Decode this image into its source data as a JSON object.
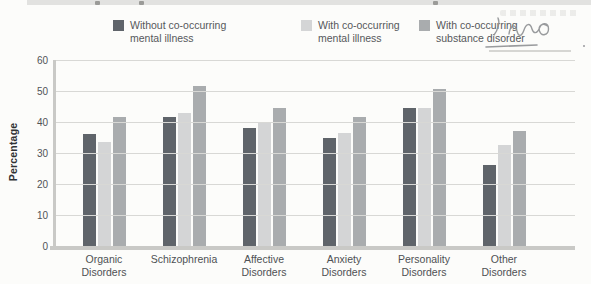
{
  "page": {
    "background": "#fcfcfa",
    "top_strip_color": "#e2e2e0"
  },
  "annotations": {
    "handwriting_present": true,
    "handwriting_color": "#8f9194"
  },
  "chart_data": {
    "type": "bar",
    "title": "",
    "xlabel": "",
    "ylabel": "Percentage",
    "ylim": [
      0,
      60
    ],
    "yticks": [
      0,
      10,
      20,
      30,
      40,
      50,
      60
    ],
    "grid": true,
    "legend_position": "top",
    "categories": [
      "Organic Disorders",
      "Schizophrenia",
      "Affective Disorders",
      "Anxiety Disorders",
      "Personality Disorders",
      "Other Disorders"
    ],
    "series": [
      {
        "name": "Without co-occurring mental illness",
        "name_lines": [
          "Without co-occurring",
          "mental illness"
        ],
        "color": "#5f646a",
        "values": [
          36,
          41.5,
          38,
          35,
          44.5,
          26
        ]
      },
      {
        "name": "With co-occurring mental illness",
        "name_lines": [
          "With co-occurring",
          "mental illness"
        ],
        "color": "#d4d5d6",
        "values": [
          33.5,
          43,
          40,
          36.5,
          44.5,
          32.5
        ]
      },
      {
        "name": "With co-occurring substance disorder",
        "name_lines": [
          "With co-occurring",
          "substance disorder"
        ],
        "color": "#a9acae",
        "values": [
          41.5,
          51.5,
          44.5,
          41.5,
          50.5,
          37
        ]
      }
    ],
    "colors": {
      "gridline": "#d8d8d5",
      "axis": "#c9c9c6",
      "tick_text": "#515356",
      "label_text": "#4e5154"
    }
  }
}
